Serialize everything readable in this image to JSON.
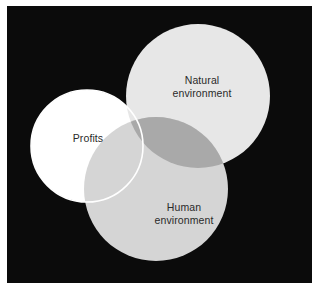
{
  "figure": {
    "type": "venn-diagram",
    "set_count": 3,
    "panel_background_color": "#0b0b0b",
    "page_background_color": "#ffffff"
  },
  "chart_data": {
    "type": "venn",
    "title": "",
    "subtitle": "",
    "xlabel": "",
    "ylabel": "",
    "legend_position": "none",
    "grid": false,
    "background_color": "#0b0b0b",
    "sets": [
      {
        "id": "profits",
        "label": "Profits",
        "label_lines": [
          "Profits"
        ],
        "fill_color": "#ffffff",
        "stroke_color": "#ffffff",
        "opacity": 1.0,
        "center": [
          80,
          140
        ],
        "radius": 56,
        "draw_order": 1
      },
      {
        "id": "natural-environment",
        "label": "Natural environment",
        "label_lines": [
          "Natural",
          "environment"
        ],
        "fill_color": "#e7e7e7",
        "stroke_color": "none",
        "opacity": 1.0,
        "center": [
          191,
          90
        ],
        "radius": 72,
        "draw_order": 2
      },
      {
        "id": "human-environment",
        "label": "Human environment",
        "label_lines": [
          "Human",
          "environment"
        ],
        "fill_color": "#d5d5d5",
        "stroke_color": "none",
        "opacity": 1.0,
        "center": [
          149,
          183
        ],
        "radius": 72,
        "draw_order": 3
      }
    ],
    "intersections": [
      {
        "id": "natural-human",
        "sets": [
          "natural-environment",
          "human-environment"
        ],
        "fill_color": "#a9a9a9",
        "label": ""
      }
    ],
    "label_text_color": "#2a2a2a"
  },
  "labels": {
    "profits": {
      "line1": "Profits"
    },
    "natural": {
      "line1": "Natural",
      "line2": "environment"
    },
    "human": {
      "line1": "Human",
      "line2": "environment"
    }
  }
}
